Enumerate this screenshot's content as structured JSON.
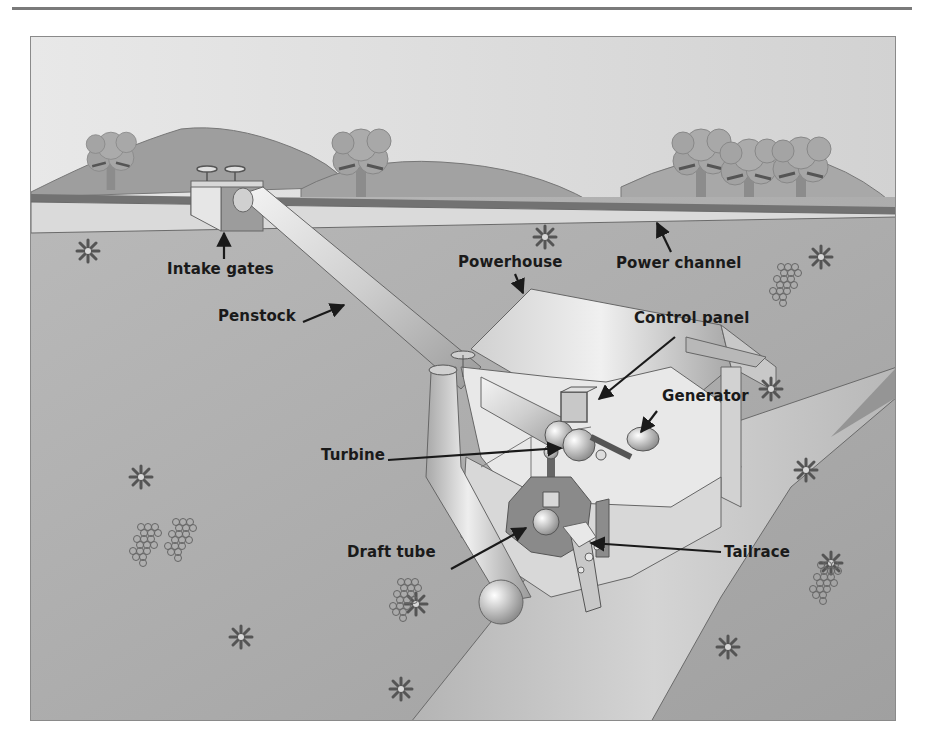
{
  "figure": {
    "labels": {
      "intake_gates": "Intake gates",
      "power_channel": "Power channel",
      "powerhouse": "Powerhouse",
      "penstock": "Penstock",
      "control_panel": "Control panel",
      "generator": "Generator",
      "turbine": "Turbine",
      "draft_tube": "Draft tube",
      "tailrace": "Tailrace"
    },
    "colors": {
      "sky": "#e4e4e4",
      "hill": "#9c9c9c",
      "hill_far": "#b0b0b0",
      "ground": "#aeaeae",
      "channel": "#d9d9d9",
      "channel_edge": "#6a6a6a",
      "river": "#c4c4c4",
      "river_bank": "#8e8e8e",
      "pipe_light": "#efefef",
      "pipe_dark": "#9a9a9a",
      "building_wall": "#e6e6e6",
      "building_roof": "#d4d4d4",
      "label_text": "#1a1a1a"
    }
  }
}
